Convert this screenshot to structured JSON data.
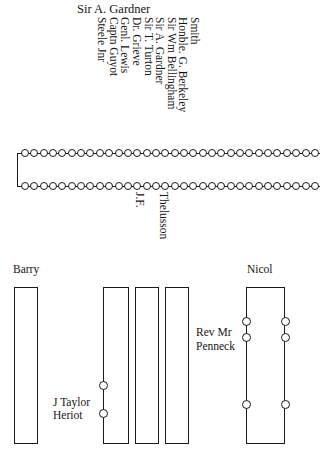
{
  "diagram": {
    "title_top": "Sir A. Gardner",
    "rotated_names_top": [
      "Smith",
      "Honble. G. Berkeley",
      "Sir Wm Bellingham",
      "Sir A. Gardner",
      "Sir T. Turton",
      "Dr. Grieve",
      "Genl. Lewis",
      "Captn Guyot",
      "Steele Jnr"
    ],
    "rotated_names_bottom": [
      "J.F.",
      "Thelusson"
    ],
    "pew_labels": {
      "barry": "Barry",
      "nicol": "Nicol",
      "taylor_line1": "J Taylor",
      "taylor_line2": "Heriot",
      "penneck_line1": "Rev Mr",
      "penneck_line2": "Penneck"
    },
    "chain": {
      "top_row_bead_count": 32,
      "bottom_row_bead_count": 32
    },
    "colors": {
      "ink": "#1a1a1a",
      "paper": "#ffffff"
    }
  }
}
